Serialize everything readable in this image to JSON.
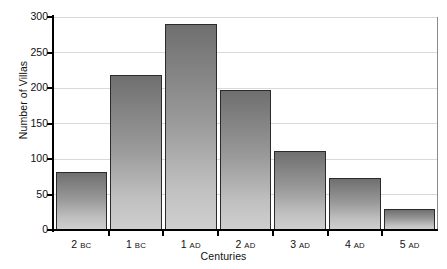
{
  "chart_data": {
    "type": "bar",
    "title": "",
    "categories": [
      "2 BC",
      "1 BC",
      "1 AD",
      "2 AD",
      "3 AD",
      "4 AD",
      "5 AD"
    ],
    "category_parts": [
      {
        "number": "2",
        "era": "BC"
      },
      {
        "number": "1",
        "era": "BC"
      },
      {
        "number": "1",
        "era": "AD"
      },
      {
        "number": "2",
        "era": "AD"
      },
      {
        "number": "3",
        "era": "AD"
      },
      {
        "number": "4",
        "era": "AD"
      },
      {
        "number": "5",
        "era": "AD"
      }
    ],
    "values": [
      81,
      218,
      290,
      197,
      111,
      73,
      29
    ],
    "xlabel": "Centuries",
    "ylabel": "Number of Villas",
    "ylim": [
      0,
      300
    ],
    "yticks": [
      0,
      50,
      100,
      150,
      200,
      250,
      300
    ],
    "ytick_labels": [
      "0",
      "50",
      "100",
      "150",
      "200",
      "250",
      "300"
    ],
    "grid": true,
    "legend": false,
    "bar_fill_top": "#6f6f6f",
    "bar_fill_bottom": "#cfcfcf",
    "bar_edge": "#2b2b2b",
    "gridline_color": "#d9d9d9",
    "axis_color": "#000000"
  }
}
